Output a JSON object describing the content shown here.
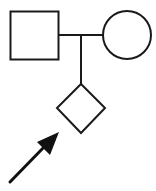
{
  "diagram": {
    "type": "pedigree",
    "nodes": [
      {
        "id": "father",
        "shape": "square",
        "meaning": "male"
      },
      {
        "id": "mother",
        "shape": "circle",
        "meaning": "female"
      },
      {
        "id": "child",
        "shape": "diamond",
        "meaning": "sex unspecified",
        "proband": true
      }
    ],
    "edges": [
      {
        "type": "mating-line",
        "from": "father",
        "to": "mother"
      },
      {
        "type": "descent-line",
        "from": "mating-line",
        "to": "child"
      }
    ],
    "proband_indicator": "arrow",
    "colors": {
      "stroke": "#1a1a1a",
      "fill": "#ffffff"
    }
  }
}
